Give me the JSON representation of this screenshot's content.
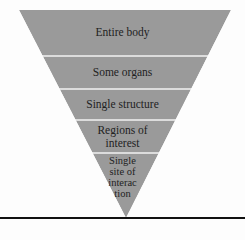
{
  "diagram": {
    "type": "inverted-pyramid",
    "fill_color": "#9a9a9a",
    "separator_color": "#f2f2f2",
    "baseline_color": "#111111",
    "levels": [
      {
        "label": "Entire body"
      },
      {
        "label": "Some organs"
      },
      {
        "label": "Single structure"
      },
      {
        "label_lines": [
          "Regions of",
          "interest"
        ]
      },
      {
        "label_lines": [
          "Single",
          "site of",
          "interac",
          "tion"
        ]
      }
    ]
  }
}
